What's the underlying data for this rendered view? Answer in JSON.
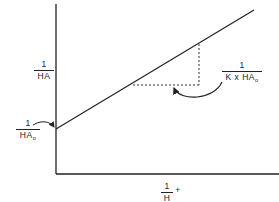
{
  "diagram": {
    "type": "lineweaver-burk-style linear plot",
    "y_axis_label": {
      "numerator": "1",
      "denominator": "HA"
    },
    "x_axis_label": {
      "numerator": "1",
      "denominator": "H",
      "suffix": "+"
    },
    "intercept_label": {
      "numerator": "1",
      "denominator": "HA",
      "subscript": "o"
    },
    "slope_label": {
      "numerator": "1",
      "denominator": "K x HA",
      "subscript": "o"
    },
    "colors": {
      "ink": "#222222",
      "background": "#ffffff"
    }
  }
}
